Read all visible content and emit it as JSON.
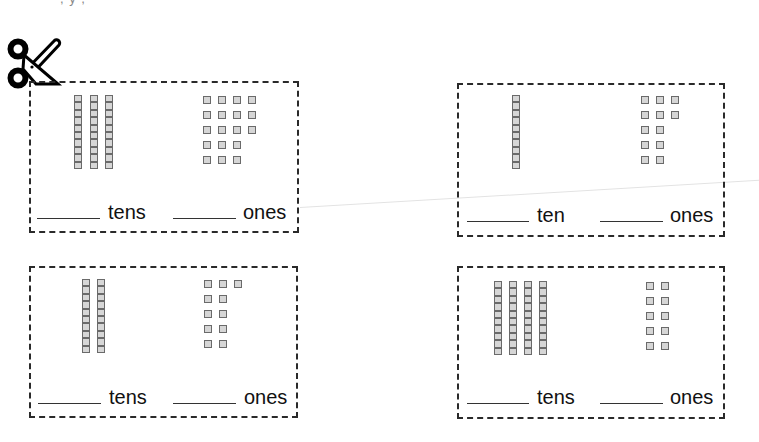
{
  "page": {
    "top_text_fragment": ", y ,"
  },
  "cards": [
    {
      "id": 1,
      "tens_rods": 3,
      "ones_rows": [
        4,
        4,
        4,
        3,
        3
      ],
      "ones_total": 18,
      "tens_label": "tens",
      "ones_label": "ones",
      "tens_answer": "",
      "ones_answer": ""
    },
    {
      "id": 2,
      "tens_rods": 1,
      "ones_rows": [
        3,
        3,
        2,
        2,
        2
      ],
      "ones_total": 12,
      "tens_label": "ten",
      "ones_label": "ones",
      "tens_answer": "",
      "ones_answer": ""
    },
    {
      "id": 3,
      "tens_rods": 2,
      "ones_rows": [
        3,
        2,
        2,
        2,
        2
      ],
      "ones_total": 11,
      "tens_label": "tens",
      "ones_label": "ones",
      "tens_answer": "",
      "ones_answer": ""
    },
    {
      "id": 4,
      "tens_rods": 4,
      "ones_rows": [
        2,
        2,
        2,
        2,
        2
      ],
      "ones_total": 10,
      "tens_label": "tens",
      "ones_label": "ones",
      "tens_answer": "",
      "ones_answer": ""
    }
  ],
  "icons": {
    "scissors": "scissors-icon"
  },
  "colors": {
    "border": "#2a2a2a",
    "block_fill": "#d6d6d6",
    "block_stroke": "#6a6a6a",
    "text": "#111111"
  }
}
